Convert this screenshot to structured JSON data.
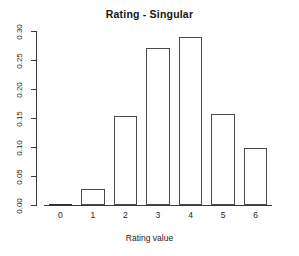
{
  "chart_data": {
    "type": "bar",
    "title": "Rating - Singular",
    "xlabel": "Rating value",
    "ylabel": "",
    "categories": [
      "0",
      "1",
      "2",
      "3",
      "4",
      "5",
      "6"
    ],
    "values": [
      0.001,
      0.027,
      0.153,
      0.271,
      0.29,
      0.157,
      0.098
    ],
    "ylim": [
      0.0,
      0.3
    ],
    "ytick_labels": [
      "0.30",
      "0.25",
      "0.20",
      "0.15",
      "0.10",
      "0.05",
      "0.00"
    ],
    "ytick_values": [
      0.3,
      0.25,
      0.2,
      0.15,
      0.1,
      0.05,
      0.0
    ],
    "xtick_labels": [
      "0",
      "1",
      "2",
      "3",
      "4",
      "5",
      "6"
    ],
    "grid": false,
    "legend": false,
    "bar_fill_color": "#ffffff",
    "bar_border_color": "#4a4a4a",
    "axis_color": "#3a3a3a",
    "background_color": "#ffffff"
  }
}
